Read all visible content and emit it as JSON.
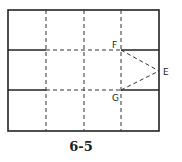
{
  "figure": {
    "caption": "6-5",
    "colors": {
      "line": "#222222",
      "background": "#ffffff"
    },
    "frame": {
      "x1": 8,
      "y1": 10,
      "x2": 159,
      "y2": 131
    },
    "dashed_verticals_x": [
      46,
      84,
      121
    ],
    "solid_horizontals": [
      {
        "name": "top-left-fold",
        "x1": 8,
        "x2": 46,
        "y": 50
      },
      {
        "name": "top-right-fold",
        "x1": 121,
        "x2": 159,
        "y": 50
      },
      {
        "name": "bottom-left-fold",
        "x1": 8,
        "x2": 46,
        "y": 90
      },
      {
        "name": "bottom-right-fold",
        "x1": 121,
        "x2": 159,
        "y": 90
      }
    ],
    "dashed_horizontals": [
      {
        "x1": 46,
        "x2": 121,
        "y": 50
      },
      {
        "x1": 46,
        "x2": 121,
        "y": 90
      }
    ],
    "points": {
      "E": {
        "label": "E",
        "x": 159,
        "y": 71,
        "lx": 163,
        "ly": 75
      },
      "F": {
        "label": "F",
        "x": 121,
        "y": 50,
        "lx": 112,
        "ly": 48
      },
      "G": {
        "label": "G",
        "x": 121,
        "y": 90,
        "lx": 112,
        "ly": 101
      }
    }
  }
}
